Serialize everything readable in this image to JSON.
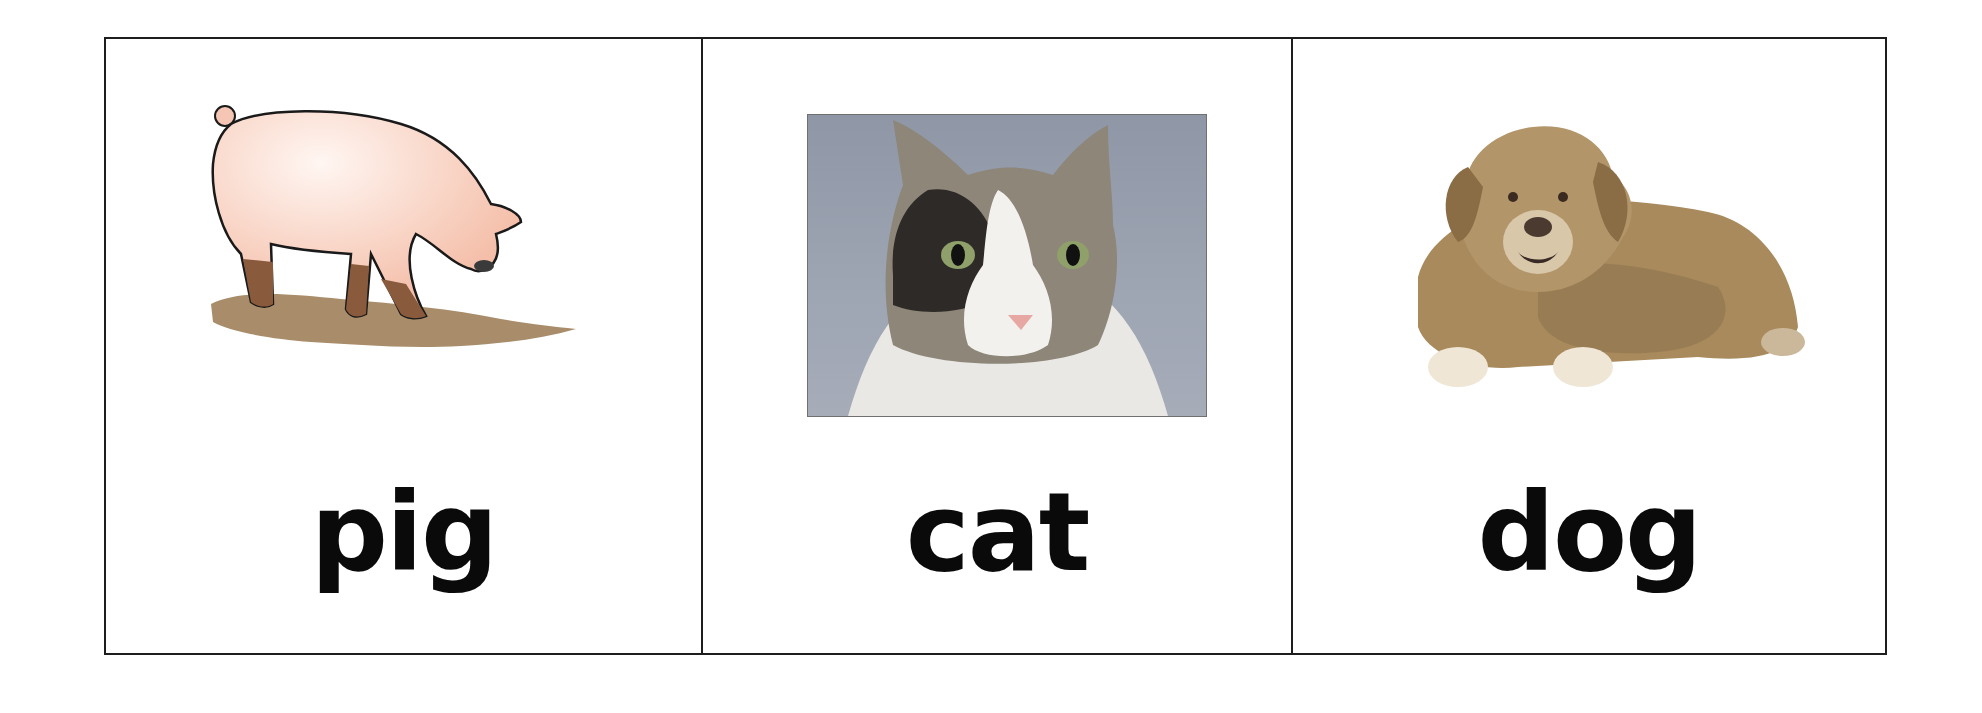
{
  "cards": [
    {
      "word": "pig",
      "image": "pig-illustration",
      "image_type": "cartoon illustration of a pink pig standing in mud"
    },
    {
      "word": "cat",
      "image": "cat-photo",
      "image_type": "photograph of a grey and white long-haired cat on grey background"
    },
    {
      "word": "dog",
      "image": "dog-photo",
      "image_type": "photograph of a golden retriever lying down on white background"
    }
  ],
  "colors": {
    "border": "#1e1e1e",
    "text": "#0a0a0a",
    "pig_body": "#f6cbb8",
    "mud": "#a98d6a",
    "cat_bg": "#9aa1af",
    "dog_fur": "#a88a5c"
  }
}
